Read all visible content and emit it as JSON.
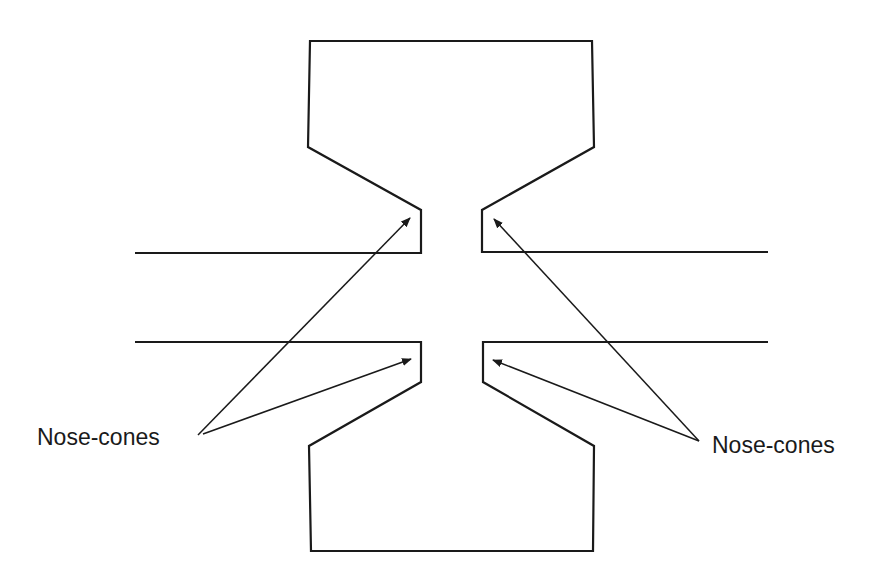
{
  "diagram": {
    "colors": {
      "stroke": "#1a1a1a",
      "background": "#ffffff",
      "text": "#1a1a1a"
    },
    "labels": {
      "left": "Nose-cones",
      "right": "Nose-cones"
    },
    "shapes": {
      "top_piece": "310,41 592,41 594,147 482,210 482,252 768,252",
      "top_piece_left": "135,253 421,253 421,210 308,147 310,41",
      "bottom_piece_left": "135,342 421,342 421,382 309,446 311,551 593,551 594,446 483,382 483,342 768,342"
    },
    "arrows": [
      {
        "name": "left-arrow-upper",
        "from": [
          198,
          435
        ],
        "to": [
          410,
          218
        ]
      },
      {
        "name": "left-arrow-lower",
        "from": [
          203,
          434
        ],
        "to": [
          411,
          359
        ]
      },
      {
        "name": "right-arrow-upper",
        "from": [
          699,
          441
        ],
        "to": [
          494,
          219
        ]
      },
      {
        "name": "right-arrow-lower",
        "from": [
          699,
          441
        ],
        "to": [
          493,
          360
        ]
      }
    ]
  }
}
